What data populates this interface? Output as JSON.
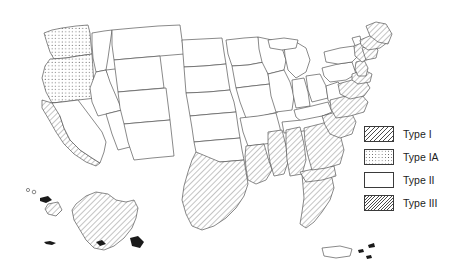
{
  "figure": {
    "background_color": "#ffffff",
    "outline_color": "#4a4a4a",
    "hatch_color": "#4a4a4a"
  },
  "legend": {
    "position": "right",
    "items": [
      {
        "key": "type_i",
        "label": "Type I",
        "pattern": "diagonal-hatch",
        "swatch_class": "swatch-typeI"
      },
      {
        "key": "type_ia",
        "label": "Type IA",
        "pattern": "dotted",
        "swatch_class": "swatch-typeIA"
      },
      {
        "key": "type_ii",
        "label": "Type II",
        "pattern": "none",
        "swatch_class": "swatch-typeII"
      },
      {
        "key": "type_iii",
        "label": "Type III",
        "pattern": "dense-diagonal-hatch",
        "swatch_class": "swatch-typeIII"
      }
    ]
  },
  "map": {
    "title": "",
    "region": "United States",
    "includes_insets": [
      "Alaska",
      "Hawaii",
      "Puerto Rico"
    ],
    "classification": {
      "type_ia_dotted": [
        "Washington",
        "Oregon"
      ],
      "type_hatched": [
        "California (coastal)",
        "Texas (eastern/gulf)",
        "Louisiana",
        "Mississippi",
        "Alabama",
        "Florida",
        "Georgia (coastal)",
        "South Carolina (coastal)",
        "North Carolina (coastal)",
        "Virginia (coastal)",
        "Maryland (coastal)",
        "Delaware",
        "New Jersey",
        "New York (coastal)",
        "Connecticut",
        "Rhode Island",
        "Massachusetts",
        "New Hampshire (coastal)",
        "Maine (coastal)",
        "Alaska",
        "Hawaii (big island)"
      ],
      "type_ii_blank": [
        "Idaho",
        "Nevada",
        "Utah",
        "Arizona",
        "Montana",
        "Wyoming",
        "Colorado",
        "New Mexico",
        "North Dakota",
        "South Dakota",
        "Nebraska",
        "Kansas",
        "Oklahoma",
        "Minnesota",
        "Iowa",
        "Missouri",
        "Arkansas",
        "Wisconsin",
        "Illinois",
        "Michigan",
        "Indiana",
        "Ohio",
        "Kentucky",
        "Tennessee",
        "West Virginia",
        "Pennsylvania",
        "Vermont",
        "Puerto Rico"
      ]
    }
  }
}
